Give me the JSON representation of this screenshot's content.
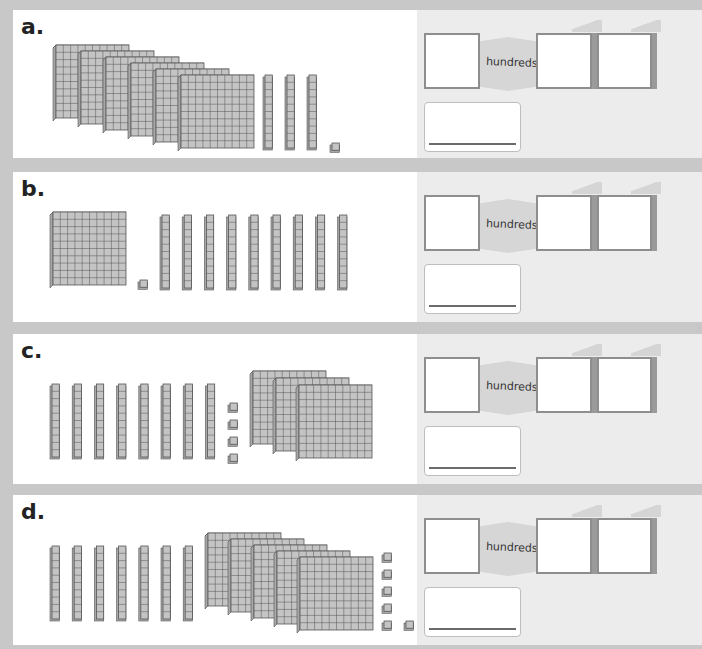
{
  "rows": [
    {
      "id": "a",
      "label": "a.",
      "hundreds": 6,
      "tens": 3,
      "ones": 1,
      "order": [
        "hundreds",
        "tens",
        "ones"
      ],
      "place_label": "hundreds"
    },
    {
      "id": "b",
      "label": "b.",
      "hundreds": 1,
      "tens": 9,
      "ones": 1,
      "order": [
        "hundreds",
        "ones",
        "tens"
      ],
      "place_label": "hundreds"
    },
    {
      "id": "c",
      "label": "c.",
      "hundreds": 3,
      "tens": 8,
      "ones": 4,
      "order": [
        "tens",
        "ones",
        "hundreds"
      ],
      "place_label": "hundreds"
    },
    {
      "id": "d",
      "label": "d.",
      "hundreds": 5,
      "tens": 7,
      "ones": 6,
      "order": [
        "tens",
        "hundreds",
        "ones"
      ],
      "place_label": "hundreds"
    }
  ],
  "colors": {
    "block_fill": "#c4c4c4",
    "block_line": "#555555",
    "panel_bg": "#ececec",
    "page_bg": "#c8c8c8"
  }
}
